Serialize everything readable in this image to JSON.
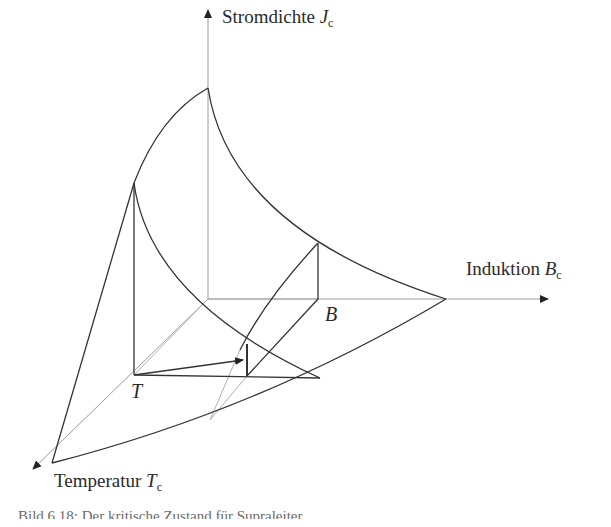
{
  "figure": {
    "axes": {
      "j": {
        "label": "Stromdichte ",
        "symbol": "J",
        "subscript": "c"
      },
      "b": {
        "label": "Induktion ",
        "symbol": "B",
        "subscript": "c"
      },
      "t": {
        "label": "Temperatur ",
        "symbol": "T",
        "subscript": "c"
      }
    },
    "points": {
      "t": "T",
      "b": "B"
    },
    "caption": "Bild 6.18: Der kritische Zustand für Supraleiter"
  },
  "colors": {
    "curve": "#333333",
    "axis": "#9a9a9a",
    "text": "#2a2a2a"
  }
}
